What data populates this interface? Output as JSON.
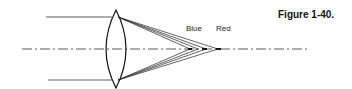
{
  "figure": {
    "caption": "Figure 1-40.",
    "labels": {
      "blue": "Blue",
      "red": "Red"
    },
    "colors": {
      "ink": "#222222",
      "background": "#ffffff"
    }
  }
}
